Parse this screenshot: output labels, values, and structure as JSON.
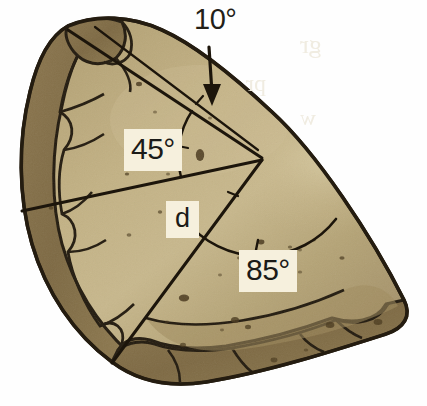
{
  "figure": {
    "kind": "annotated-rock-cross-section-diagram",
    "background_color": "#ffffff",
    "rock_body_color": "#b9a878",
    "rock_crust_color": "#8a7349",
    "rock_shadow_color": "#a3905f",
    "outline_color": "#241c10",
    "label_box_color": "#f6f0dd",
    "label_text_color": "#1b1b18"
  },
  "labels": {
    "angle_top": "10°",
    "angle_upper": "45°",
    "distance": "d",
    "angle_lower": "85°"
  },
  "annotations": {
    "arrow_target": "top-edge-of-rock",
    "arrow_direction": "down"
  },
  "bleedthrough": {
    "line1": "gr",
    "line2": "pr",
    "line3": "w"
  }
}
